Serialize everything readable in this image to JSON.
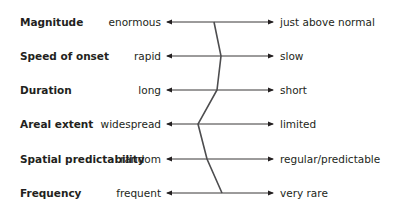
{
  "diagram": {
    "rows": [
      {
        "label": "Magnitude",
        "left": "enormous",
        "right": "just above normal",
        "y": 22,
        "profile_x": 214
      },
      {
        "label": "Speed of onset",
        "left": "rapid",
        "right": "slow",
        "y": 56,
        "profile_x": 221
      },
      {
        "label": "Duration",
        "left": "long",
        "right": "short",
        "y": 90,
        "profile_x": 217
      },
      {
        "label": "Areal extent",
        "left": "widespread",
        "right": "limited",
        "y": 124,
        "profile_x": 198
      },
      {
        "label": "Spatial predictability",
        "left": "random",
        "right": "regular/predictable",
        "y": 159,
        "profile_x": 207
      },
      {
        "label": "Frequency",
        "left": "frequent",
        "right": "very rare",
        "y": 193,
        "profile_x": 222
      }
    ],
    "axis": {
      "x_start": 167,
      "x_end": 273
    },
    "colors": {
      "text": "#231f20",
      "line": "#231f20",
      "profile": "#4d4d4f"
    }
  }
}
